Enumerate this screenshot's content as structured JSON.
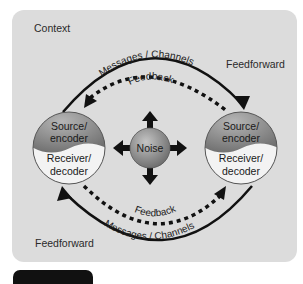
{
  "diagram": {
    "context_label": "Context",
    "feedforward_top": "Feedforward",
    "feedforward_bottom": "Feedforward",
    "top_arc": {
      "messages_label": "Messages / Channels",
      "feedback_label": "Feedback"
    },
    "bottom_arc": {
      "messages_label": "Messages / Channels",
      "feedback_label": "Feedback"
    },
    "left_node": {
      "top_label_1": "Source/",
      "top_label_2": "encoder",
      "bottom_label_1": "Receiver/",
      "bottom_label_2": "decoder"
    },
    "right_node": {
      "top_label_1": "Source/",
      "top_label_2": "encoder",
      "bottom_label_1": "Receiver/",
      "bottom_label_2": "decoder"
    },
    "noise_label": "Noise",
    "colors": {
      "panel": "#dcdcdc",
      "source_fill": "#8a8a8a",
      "receiver_fill": "#f2f2f2",
      "noise_fill": "#9a9a9a",
      "arrow": "#111111"
    }
  }
}
